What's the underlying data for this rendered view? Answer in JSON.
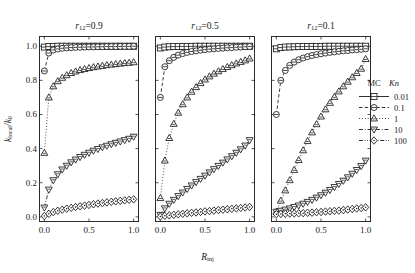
{
  "top_caption": "",
  "axes": {
    "ylabel": "k",
    "ylabel_sub": "local",
    "ylabel_den": "/k",
    "ylabel_den_sub": "0",
    "xlabel": "R",
    "xlabel_sub": "inj",
    "yticks": [
      "0.0",
      "0.2",
      "0.4",
      "0.6",
      "0.8",
      "1.0"
    ],
    "ytick_values": [
      0.0,
      0.2,
      0.4,
      0.6,
      0.8,
      1.0
    ],
    "xticks": [
      "0.0",
      "0.5",
      "1.0"
    ],
    "xtick_values": [
      0.0,
      0.5,
      1.0
    ],
    "ylim": [
      -0.03,
      1.06
    ],
    "xlim": [
      -0.06,
      1.06
    ]
  },
  "legend": {
    "col1_header": "MC",
    "col2_header": "Kn",
    "entries": [
      {
        "value": "0.01",
        "marker": "square",
        "dash": "solid"
      },
      {
        "value": "0.1",
        "marker": "circle",
        "dash": "dashed"
      },
      {
        "value": "1",
        "marker": "triangle-up",
        "dash": "dotted"
      },
      {
        "value": "10",
        "marker": "triangle-down",
        "dash": "dashdot"
      },
      {
        "value": "100",
        "marker": "diamond",
        "dash": "dashdotdot"
      }
    ]
  },
  "chart_data": {
    "type": "line",
    "title": "",
    "xlabel": "R_inj",
    "ylabel": "k_local/k_0",
    "xlim": [
      0,
      1
    ],
    "ylim": [
      0,
      1
    ],
    "grid": false,
    "legend_position": "right",
    "panels": [
      {
        "title": "r12=0.9",
        "title_prefix": "r",
        "title_sub": "12",
        "title_suffix": "=0.9",
        "x": [
          0.0,
          0.05,
          0.1,
          0.15,
          0.2,
          0.25,
          0.3,
          0.35,
          0.4,
          0.45,
          0.5,
          0.55,
          0.6,
          0.65,
          0.7,
          0.75,
          0.8,
          0.85,
          0.9,
          0.95,
          1.0
        ],
        "series": [
          {
            "name": "Kn=0.01",
            "marker": "square",
            "values": [
              0.995,
              0.998,
              0.999,
              1.0,
              1.0,
              1.0,
              1.0,
              1.0,
              1.0,
              1.0,
              1.0,
              1.0,
              1.0,
              1.0,
              1.0,
              1.0,
              1.0,
              1.0,
              1.0,
              1.0,
              1.0
            ]
          },
          {
            "name": "Kn=0.1",
            "marker": "circle",
            "values": [
              0.855,
              0.96,
              0.978,
              0.984,
              0.988,
              0.99,
              0.992,
              0.993,
              0.994,
              0.995,
              0.996,
              0.996,
              0.997,
              0.997,
              0.998,
              0.998,
              0.998,
              0.999,
              0.999,
              0.999,
              1.0
            ]
          },
          {
            "name": "Kn=1",
            "marker": "triangle-up",
            "values": [
              0.375,
              0.7,
              0.765,
              0.795,
              0.815,
              0.83,
              0.843,
              0.852,
              0.86,
              0.866,
              0.872,
              0.877,
              0.881,
              0.885,
              0.889,
              0.892,
              0.895,
              0.898,
              0.901,
              0.903,
              0.906
            ]
          },
          {
            "name": "Kn=10",
            "marker": "triangle-down",
            "values": [
              0.055,
              0.16,
              0.215,
              0.25,
              0.278,
              0.3,
              0.32,
              0.336,
              0.351,
              0.364,
              0.376,
              0.388,
              0.398,
              0.408,
              0.417,
              0.426,
              0.434,
              0.442,
              0.45,
              0.458,
              0.47
            ]
          },
          {
            "name": "Kn=100",
            "marker": "diamond",
            "values": [
              0.005,
              0.018,
              0.028,
              0.036,
              0.042,
              0.048,
              0.053,
              0.058,
              0.062,
              0.066,
              0.07,
              0.074,
              0.078,
              0.081,
              0.085,
              0.088,
              0.091,
              0.094,
              0.097,
              0.1,
              0.103
            ]
          }
        ]
      },
      {
        "title": "r12=0.5",
        "title_prefix": "r",
        "title_sub": "12",
        "title_suffix": "=0.5",
        "x": [
          0.0,
          0.05,
          0.1,
          0.15,
          0.2,
          0.25,
          0.3,
          0.35,
          0.4,
          0.45,
          0.5,
          0.55,
          0.6,
          0.65,
          0.7,
          0.75,
          0.8,
          0.85,
          0.9,
          0.95,
          1.0
        ],
        "series": [
          {
            "name": "Kn=0.01",
            "marker": "square",
            "values": [
              0.99,
              0.995,
              0.997,
              0.998,
              0.998,
              0.999,
              0.999,
              0.999,
              1.0,
              1.0,
              1.0,
              1.0,
              1.0,
              1.0,
              1.0,
              1.0,
              1.0,
              1.0,
              1.0,
              1.0,
              1.0
            ]
          },
          {
            "name": "Kn=0.1",
            "marker": "circle",
            "values": [
              0.7,
              0.88,
              0.915,
              0.935,
              0.948,
              0.957,
              0.964,
              0.969,
              0.973,
              0.977,
              0.98,
              0.983,
              0.985,
              0.987,
              0.989,
              0.991,
              0.992,
              0.994,
              0.995,
              0.997,
              0.998
            ]
          },
          {
            "name": "Kn=1",
            "marker": "triangle-up",
            "values": [
              0.11,
              0.33,
              0.462,
              0.545,
              0.61,
              0.66,
              0.7,
              0.733,
              0.76,
              0.784,
              0.805,
              0.823,
              0.839,
              0.853,
              0.866,
              0.878,
              0.889,
              0.899,
              0.908,
              0.917,
              0.928
            ]
          },
          {
            "name": "Kn=10",
            "marker": "triangle-down",
            "values": [
              0.012,
              0.05,
              0.077,
              0.1,
              0.122,
              0.143,
              0.164,
              0.184,
              0.204,
              0.223,
              0.242,
              0.261,
              0.28,
              0.299,
              0.318,
              0.337,
              0.356,
              0.376,
              0.396,
              0.418,
              0.45
            ]
          },
          {
            "name": "Kn=100",
            "marker": "diamond",
            "values": [
              0.002,
              0.006,
              0.009,
              0.012,
              0.015,
              0.018,
              0.021,
              0.024,
              0.026,
              0.029,
              0.032,
              0.034,
              0.037,
              0.04,
              0.042,
              0.045,
              0.047,
              0.05,
              0.052,
              0.055,
              0.058
            ]
          }
        ]
      },
      {
        "title": "r12=0.1",
        "title_prefix": "r",
        "title_sub": "12",
        "title_suffix": "=0.1",
        "x": [
          0.0,
          0.05,
          0.1,
          0.15,
          0.2,
          0.25,
          0.3,
          0.35,
          0.4,
          0.45,
          0.5,
          0.55,
          0.6,
          0.65,
          0.7,
          0.75,
          0.8,
          0.85,
          0.9,
          0.95,
          1.0
        ],
        "series": [
          {
            "name": "Kn=0.01",
            "marker": "square",
            "values": [
              0.985,
              0.992,
              0.995,
              0.996,
              0.997,
              0.998,
              0.998,
              0.999,
              0.999,
              0.999,
              0.999,
              1.0,
              1.0,
              1.0,
              1.0,
              1.0,
              1.0,
              1.0,
              1.0,
              1.0,
              1.0
            ]
          },
          {
            "name": "Kn=0.1",
            "marker": "circle",
            "values": [
              0.6,
              0.8,
              0.858,
              0.888,
              0.907,
              0.921,
              0.931,
              0.939,
              0.946,
              0.951,
              0.956,
              0.96,
              0.964,
              0.967,
              0.97,
              0.973,
              0.975,
              0.978,
              0.98,
              0.982,
              0.985
            ]
          },
          {
            "name": "Kn=1",
            "marker": "triangle-up",
            "values": [
              0.03,
              0.095,
              0.155,
              0.215,
              0.275,
              0.333,
              0.39,
              0.444,
              0.495,
              0.543,
              0.588,
              0.63,
              0.668,
              0.703,
              0.735,
              0.765,
              0.792,
              0.818,
              0.843,
              0.868,
              0.925
            ]
          },
          {
            "name": "Kn=10",
            "marker": "triangle-down",
            "values": [
              0.03,
              0.036,
              0.043,
              0.05,
              0.058,
              0.067,
              0.077,
              0.088,
              0.1,
              0.113,
              0.127,
              0.142,
              0.158,
              0.175,
              0.193,
              0.212,
              0.232,
              0.253,
              0.275,
              0.298,
              0.33
            ]
          },
          {
            "name": "Kn=100",
            "marker": "diamond",
            "values": [
              0.016,
              0.017,
              0.018,
              0.019,
              0.02,
              0.021,
              0.022,
              0.024,
              0.025,
              0.027,
              0.029,
              0.031,
              0.033,
              0.035,
              0.037,
              0.04,
              0.043,
              0.046,
              0.049,
              0.052,
              0.056
            ]
          }
        ]
      }
    ]
  }
}
